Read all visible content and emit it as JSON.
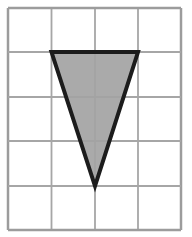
{
  "diagram": {
    "type": "grid-figure",
    "grid": {
      "columns": 4,
      "rows": 5,
      "x_lines": [
        8,
        51.5,
        95,
        138,
        181
      ],
      "y_lines": [
        8,
        52,
        97,
        141,
        186,
        230
      ],
      "line_color": "#a6a6a6",
      "border_color": "#9c9c9c"
    },
    "shape": {
      "kind": "triangle",
      "vertices_grid": [
        [
          1,
          1
        ],
        [
          3,
          1
        ],
        [
          2,
          4
        ]
      ],
      "points": "51.5,52 138,52 95,186",
      "fill_color": "#a3a3a3",
      "stroke_color": "#1c1c1c",
      "stroke_width": 4
    },
    "background_color": "#ffffff"
  }
}
